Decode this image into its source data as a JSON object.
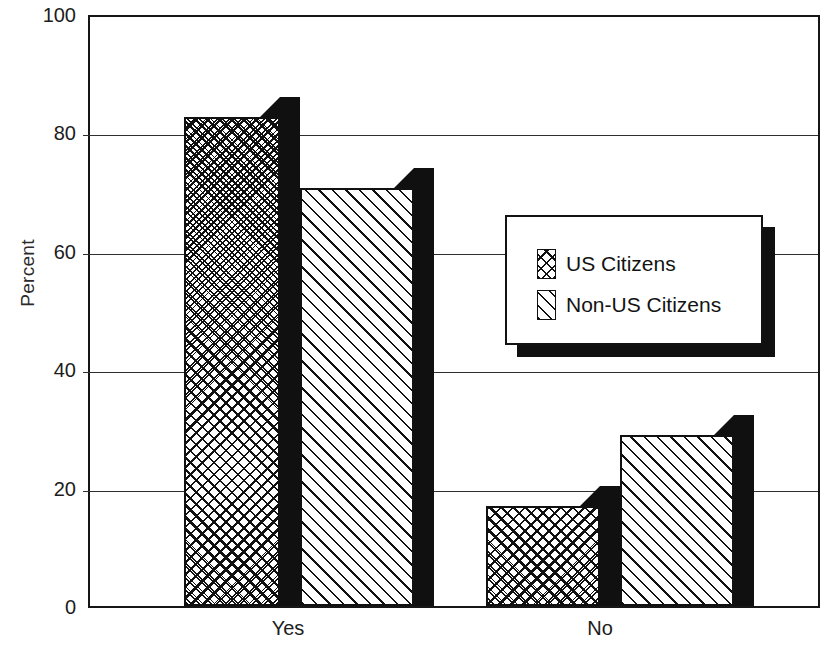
{
  "chart_data": {
    "type": "bar",
    "title": "",
    "subtitle": "",
    "xlabel": "",
    "ylabel": "Percent",
    "categories": [
      "Yes",
      "No"
    ],
    "series": [
      {
        "name": "US Citizens",
        "pattern": "crosshatch",
        "values": [
          83,
          17
        ]
      },
      {
        "name": "Non-US Citizens",
        "pattern": "diagonal",
        "values": [
          71,
          29
        ]
      }
    ],
    "ylim": [
      0,
      100
    ],
    "yticks": [
      0,
      20,
      40,
      60,
      80,
      100
    ],
    "ytick_labels": [
      "0",
      "20",
      "40",
      "60",
      "80",
      "100"
    ],
    "grid": true,
    "grid_axis": "y",
    "legend_position": "center-right",
    "style": "black-and-white hatched 3D bars",
    "colors": {
      "background": "#ffffff",
      "line": "#161616",
      "bar_side_3d": "#101010",
      "text": "#1c1c1c"
    }
  },
  "axes": {
    "y_title": "Percent",
    "x_tick_labels": [
      "Yes",
      "No"
    ],
    "y_tick_labels": [
      "100",
      "80",
      "60",
      "40",
      "20",
      "0"
    ]
  },
  "legend": {
    "entries": [
      {
        "label": "US Citizens",
        "swatch": "crosshatch-swatch-icon"
      },
      {
        "label": "Non-US Citizens",
        "swatch": "diagonal-swatch-icon"
      }
    ]
  }
}
